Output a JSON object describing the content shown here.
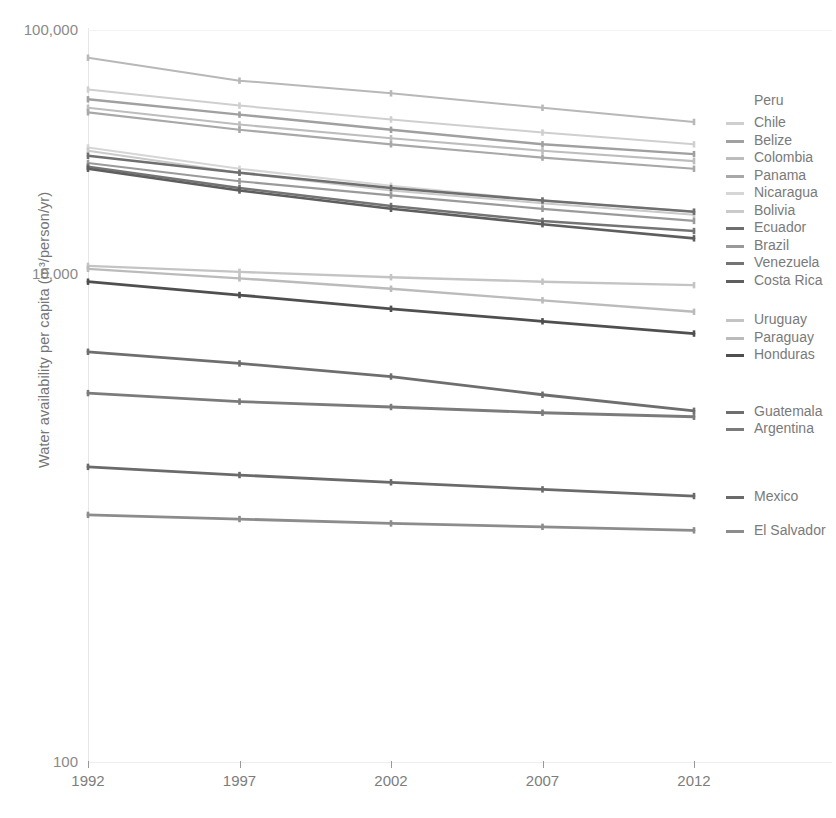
{
  "chart_data": {
    "type": "line",
    "title": "",
    "xlabel": "",
    "ylabel": "Water availability per capita (m³/person/yr)",
    "x": [
      1992,
      1997,
      2002,
      2007,
      2012
    ],
    "xticklabels": [
      "1992",
      "1997",
      "2002",
      "2007",
      "2012"
    ],
    "yticklabels": [
      "100,000",
      "10,000",
      "100"
    ],
    "ytickvalues": [
      100000,
      10000,
      100
    ],
    "yscale": "log",
    "ylim": [
      100,
      100000
    ],
    "grid": false,
    "legend_position": "right",
    "series": [
      {
        "name": "Peru",
        "color": "#b8b8b8",
        "width": 2.0,
        "values": [
          77000,
          62000,
          55000,
          48000,
          42000
        ]
      },
      {
        "name": "Chile",
        "color": "#cfcfcf",
        "width": 2.0,
        "values": [
          57000,
          49000,
          43000,
          38000,
          34000
        ]
      },
      {
        "name": "Belize",
        "color": "#a0a0a0",
        "width": 2.4,
        "values": [
          52000,
          45000,
          39000,
          34000,
          31000
        ]
      },
      {
        "name": "Colombia",
        "color": "#bdbdbd",
        "width": 2.2,
        "values": [
          48000,
          41000,
          36000,
          32000,
          29000
        ]
      },
      {
        "name": "Panama",
        "color": "#a8a8a8",
        "width": 2.2,
        "values": [
          46000,
          39000,
          34000,
          30000,
          27000
        ]
      },
      {
        "name": "Nicaragua",
        "color": "#d6d6d6",
        "width": 2.2,
        "values": [
          33000,
          27000,
          23000,
          20000,
          18000
        ]
      },
      {
        "name": "Bolivia",
        "color": "#cacaca",
        "width": 2.0,
        "values": [
          32000,
          26000,
          22000,
          19500,
          17500
        ]
      },
      {
        "name": "Ecuador",
        "color": "#6f6f6f",
        "width": 2.6,
        "values": [
          30500,
          26000,
          22500,
          20000,
          18000
        ]
      },
      {
        "name": "Brazil",
        "color": "#9a9a9a",
        "width": 2.2,
        "values": [
          28500,
          24000,
          21000,
          18500,
          16500
        ]
      },
      {
        "name": "Venezuela",
        "color": "#747474",
        "width": 2.6,
        "values": [
          27500,
          22500,
          19000,
          16500,
          15000
        ]
      },
      {
        "name": "Costa Rica",
        "color": "#5e5e5e",
        "width": 2.6,
        "values": [
          27000,
          22000,
          18500,
          16000,
          14000
        ]
      },
      {
        "name": "Uruguay",
        "color": "#c4c4c4",
        "width": 2.4,
        "values": [
          10800,
          10200,
          9700,
          9300,
          9000
        ]
      },
      {
        "name": "Paraguay",
        "color": "#bbbbbb",
        "width": 2.4,
        "values": [
          10500,
          9600,
          8700,
          7800,
          7000
        ]
      },
      {
        "name": "Honduras",
        "color": "#4f4f4f",
        "width": 2.8,
        "values": [
          9300,
          8200,
          7200,
          6400,
          5700
        ]
      },
      {
        "name": "Guatemala",
        "color": "#6e6e6e",
        "width": 2.8,
        "values": [
          4800,
          4300,
          3800,
          3200,
          2750
        ]
      },
      {
        "name": "Argentina",
        "color": "#7b7b7b",
        "width": 2.8,
        "values": [
          3250,
          3000,
          2850,
          2700,
          2600
        ]
      },
      {
        "name": "Mexico",
        "color": "#6a6a6a",
        "width": 2.8,
        "values": [
          1620,
          1500,
          1400,
          1310,
          1230
        ]
      },
      {
        "name": "El Salvador",
        "color": "#8c8c8c",
        "width": 2.8,
        "values": [
          1030,
          990,
          950,
          920,
          890
        ]
      }
    ]
  },
  "legend": {
    "entries": [
      {
        "label": "Peru"
      },
      {
        "label": "Chile"
      },
      {
        "label": "Belize"
      },
      {
        "label": "Colombia"
      },
      {
        "label": "Panama"
      },
      {
        "label": "Nicaragua"
      },
      {
        "label": "Bolivia"
      },
      {
        "label": "Ecuador"
      },
      {
        "label": "Brazil"
      },
      {
        "label": "Venezuela"
      },
      {
        "label": "Costa Rica"
      },
      {
        "label": "Uruguay"
      },
      {
        "label": "Paraguay"
      },
      {
        "label": "Honduras"
      },
      {
        "label": "Guatemala"
      },
      {
        "label": "Argentina"
      },
      {
        "label": "Mexico"
      },
      {
        "label": "El Salvador"
      }
    ]
  }
}
